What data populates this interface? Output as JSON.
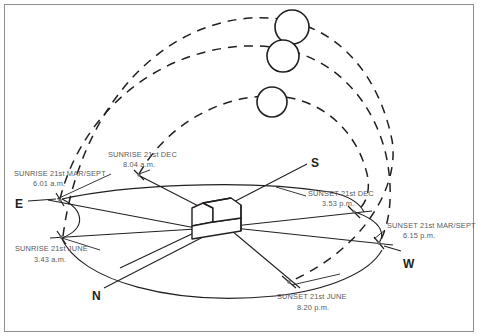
{
  "diagram": {
    "frame_color": "#8d8d8d",
    "ink_color": "#231f20",
    "label_color": "#5a5a5a"
  },
  "compass": {
    "east": "E",
    "south": "S",
    "west": "W",
    "north": "N"
  },
  "events": [
    {
      "id": "sunrise-mar-sept",
      "name": "SUNRISE 21st MAR/SEPT",
      "time": "6.01 a.m.",
      "label_x": 14,
      "label_y": 176,
      "time_x": 33,
      "time_y": 186,
      "point_x": 59,
      "point_y": 200
    },
    {
      "id": "sunrise-dec",
      "name": "SUNRISE 21st DEC",
      "time": "8.04 a.m.",
      "label_x": 108,
      "label_y": 157,
      "time_x": 123,
      "time_y": 167,
      "point_x": 138,
      "point_y": 175
    },
    {
      "id": "sunrise-june",
      "name": "SUNRISE 21st JUNE",
      "time": "3.43 a.m.",
      "label_x": 15,
      "label_y": 251,
      "time_x": 34,
      "time_y": 262,
      "point_x": 61,
      "point_y": 237
    },
    {
      "id": "sunset-dec",
      "name": "SUNSET 21st DEC",
      "time": "3.53 p.m.",
      "label_x": 308,
      "label_y": 196,
      "time_x": 322,
      "time_y": 206,
      "point_x": 354,
      "point_y": 212
    },
    {
      "id": "sunset-mar-sept",
      "name": "SUNSET 21st MAR/SEPT",
      "time": "6.15 p.m.",
      "label_x": 387,
      "label_y": 228,
      "time_x": 403,
      "time_y": 238,
      "point_x": 379,
      "point_y": 243
    },
    {
      "id": "sunset-june",
      "name": "SUNSET 21st JUNE",
      "time": "8.20 p.m.",
      "label_x": 277,
      "label_y": 299,
      "time_x": 297,
      "time_y": 310,
      "point_x": 289,
      "point_y": 282
    }
  ],
  "suns": [
    {
      "id": "sun-high",
      "cx": 292,
      "cy": 27,
      "r": 17
    },
    {
      "id": "sun-mid",
      "cx": 283,
      "cy": 56,
      "r": 16
    },
    {
      "id": "sun-low",
      "cx": 272,
      "cy": 102,
      "r": 15
    }
  ],
  "paths": [
    {
      "id": "sun-path-june",
      "season": "21st JUNE",
      "style": "dashed"
    },
    {
      "id": "sun-path-mar-sept",
      "season": "21st MAR/SEPT",
      "style": "dashed"
    },
    {
      "id": "sun-path-dec",
      "season": "21st DEC",
      "style": "dashed"
    }
  ],
  "building": {
    "id": "house",
    "description": "3D box building at the centre of the horizon plane"
  }
}
